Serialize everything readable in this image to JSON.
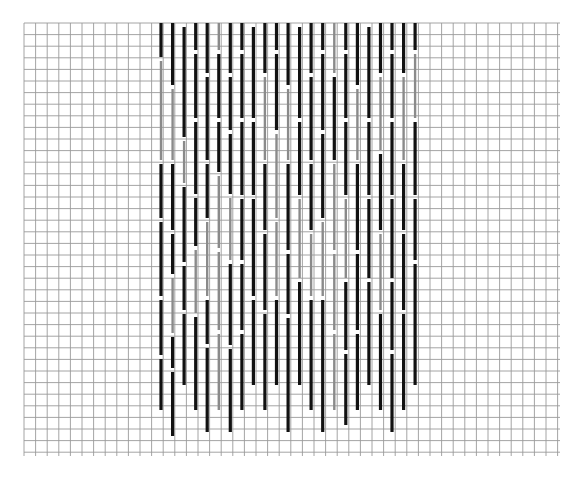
{
  "diagram": {
    "type": "needlepoint-stitch-chart",
    "grid": {
      "left": 24,
      "top": 23,
      "right": 560,
      "bottom": 456,
      "spacing": 11.6,
      "line_color": "#9a9a9a"
    },
    "colors": {
      "dark": "#111111",
      "light": "#8a8a8a",
      "background": "#ffffff"
    },
    "stitch_area": {
      "first_column_x": 161,
      "column_spacing": 11.55,
      "columns": 23
    },
    "columns": [
      {
        "segs": [
          [
            23,
            57,
            "dark"
          ],
          [
            61,
            160,
            "light"
          ],
          [
            164,
            218,
            "dark"
          ],
          [
            222,
            296,
            "dark"
          ],
          [
            300,
            355,
            "dark"
          ],
          [
            359,
            410,
            "dark"
          ]
        ]
      },
      {
        "segs": [
          [
            23,
            85,
            "dark"
          ],
          [
            89,
            160,
            "light"
          ],
          [
            164,
            230,
            "dark"
          ],
          [
            234,
            274,
            "dark"
          ],
          [
            278,
            333,
            "light"
          ],
          [
            337,
            368,
            "dark"
          ],
          [
            372,
            436,
            "dark"
          ]
        ]
      },
      {
        "segs": [
          [
            27,
            137,
            "dark"
          ],
          [
            141,
            183,
            "light"
          ],
          [
            187,
            262,
            "dark"
          ],
          [
            266,
            310,
            "dark"
          ],
          [
            314,
            385,
            "dark"
          ]
        ]
      },
      {
        "segs": [
          [
            23,
            50,
            "dark"
          ],
          [
            54,
            118,
            "dark"
          ],
          [
            122,
            194,
            "dark"
          ],
          [
            198,
            246,
            "dark"
          ],
          [
            250,
            313,
            "light"
          ],
          [
            317,
            410,
            "dark"
          ]
        ]
      },
      {
        "segs": [
          [
            23,
            73,
            "dark"
          ],
          [
            77,
            160,
            "dark"
          ],
          [
            164,
            218,
            "dark"
          ],
          [
            222,
            296,
            "light"
          ],
          [
            300,
            344,
            "dark"
          ],
          [
            348,
            432,
            "dark"
          ]
        ]
      },
      {
        "segs": [
          [
            23,
            50,
            "light"
          ],
          [
            54,
            118,
            "dark"
          ],
          [
            122,
            172,
            "dark"
          ],
          [
            176,
            248,
            "light"
          ],
          [
            252,
            330,
            "light"
          ],
          [
            334,
            410,
            "light"
          ]
        ]
      },
      {
        "segs": [
          [
            23,
            73,
            "dark"
          ],
          [
            77,
            130,
            "dark"
          ],
          [
            134,
            194,
            "dark"
          ],
          [
            198,
            260,
            "light"
          ],
          [
            264,
            345,
            "dark"
          ],
          [
            349,
            432,
            "dark"
          ]
        ]
      },
      {
        "segs": [
          [
            23,
            50,
            "dark"
          ],
          [
            54,
            118,
            "dark"
          ],
          [
            122,
            195,
            "dark"
          ],
          [
            199,
            260,
            "dark"
          ],
          [
            264,
            330,
            "dark"
          ],
          [
            334,
            410,
            "dark"
          ]
        ]
      },
      {
        "segs": [
          [
            27,
            118,
            "dark"
          ],
          [
            122,
            195,
            "dark"
          ],
          [
            199,
            296,
            "dark"
          ],
          [
            300,
            385,
            "dark"
          ]
        ]
      },
      {
        "segs": [
          [
            23,
            73,
            "dark"
          ],
          [
            77,
            160,
            "light"
          ],
          [
            164,
            230,
            "dark"
          ],
          [
            234,
            310,
            "dark"
          ],
          [
            314,
            410,
            "dark"
          ]
        ]
      },
      {
        "segs": [
          [
            23,
            50,
            "dark"
          ],
          [
            54,
            130,
            "dark"
          ],
          [
            134,
            218,
            "light"
          ],
          [
            222,
            296,
            "light"
          ],
          [
            300,
            385,
            "dark"
          ]
        ]
      },
      {
        "segs": [
          [
            23,
            85,
            "dark"
          ],
          [
            89,
            160,
            "light"
          ],
          [
            164,
            250,
            "dark"
          ],
          [
            254,
            314,
            "dark"
          ],
          [
            318,
            432,
            "dark"
          ]
        ]
      },
      {
        "segs": [
          [
            27,
            118,
            "dark"
          ],
          [
            122,
            195,
            "dark"
          ],
          [
            199,
            278,
            "light"
          ],
          [
            282,
            385,
            "dark"
          ]
        ]
      },
      {
        "segs": [
          [
            23,
            73,
            "dark"
          ],
          [
            77,
            160,
            "dark"
          ],
          [
            164,
            230,
            "dark"
          ],
          [
            234,
            296,
            "light"
          ],
          [
            300,
            410,
            "dark"
          ]
        ]
      },
      {
        "segs": [
          [
            23,
            50,
            "dark"
          ],
          [
            54,
            130,
            "dark"
          ],
          [
            134,
            218,
            "dark"
          ],
          [
            222,
            296,
            "light"
          ],
          [
            300,
            432,
            "dark"
          ]
        ]
      },
      {
        "segs": [
          [
            23,
            73,
            "light"
          ],
          [
            77,
            160,
            "dark"
          ],
          [
            164,
            250,
            "light"
          ],
          [
            254,
            330,
            "light"
          ],
          [
            334,
            410,
            "light"
          ]
        ]
      },
      {
        "segs": [
          [
            23,
            50,
            "dark"
          ],
          [
            54,
            118,
            "dark"
          ],
          [
            122,
            195,
            "dark"
          ],
          [
            199,
            278,
            "light"
          ],
          [
            282,
            350,
            "dark"
          ],
          [
            354,
            425,
            "dark"
          ]
        ]
      },
      {
        "segs": [
          [
            23,
            85,
            "dark"
          ],
          [
            89,
            160,
            "light"
          ],
          [
            164,
            250,
            "dark"
          ],
          [
            254,
            330,
            "dark"
          ],
          [
            334,
            410,
            "dark"
          ]
        ]
      },
      {
        "segs": [
          [
            27,
            118,
            "dark"
          ],
          [
            122,
            195,
            "dark"
          ],
          [
            199,
            278,
            "dark"
          ],
          [
            282,
            385,
            "dark"
          ]
        ]
      },
      {
        "segs": [
          [
            23,
            73,
            "dark"
          ],
          [
            77,
            150,
            "light"
          ],
          [
            154,
            230,
            "dark"
          ],
          [
            234,
            310,
            "light"
          ],
          [
            314,
            410,
            "dark"
          ]
        ]
      },
      {
        "segs": [
          [
            23,
            50,
            "dark"
          ],
          [
            54,
            118,
            "dark"
          ],
          [
            122,
            195,
            "dark"
          ],
          [
            199,
            278,
            "dark"
          ],
          [
            282,
            350,
            "dark"
          ],
          [
            354,
            432,
            "dark"
          ]
        ]
      },
      {
        "segs": [
          [
            23,
            73,
            "dark"
          ],
          [
            77,
            160,
            "light"
          ],
          [
            164,
            230,
            "dark"
          ],
          [
            234,
            310,
            "dark"
          ],
          [
            314,
            410,
            "dark"
          ]
        ]
      },
      {
        "segs": [
          [
            23,
            50,
            "dark"
          ],
          [
            54,
            118,
            "light"
          ],
          [
            122,
            195,
            "dark"
          ],
          [
            199,
            260,
            "dark"
          ],
          [
            264,
            385,
            "dark"
          ]
        ]
      }
    ]
  }
}
